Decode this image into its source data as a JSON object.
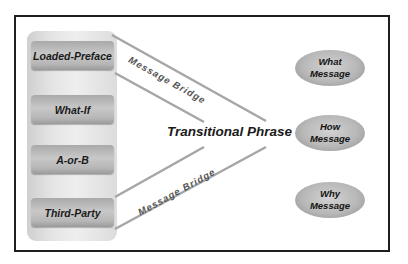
{
  "diagram": {
    "left_items": [
      {
        "label": "Loaded-Preface"
      },
      {
        "label": "What-If"
      },
      {
        "label": "A-or-B"
      },
      {
        "label": "Third-Party"
      }
    ],
    "center_label": "Transitional Phrase",
    "bridges": [
      {
        "label": "Message Bridge"
      },
      {
        "label": "Message Bridge"
      }
    ],
    "right_items": [
      {
        "line1": "What",
        "line2": "Message"
      },
      {
        "line1": "How",
        "line2": "Message"
      },
      {
        "line1": "Why",
        "line2": "Message"
      }
    ],
    "colors": {
      "frame": "#1e1e1e",
      "box": "#b6b6b6",
      "oval": "#b8b8b8",
      "line": "#a0a0a0"
    }
  }
}
